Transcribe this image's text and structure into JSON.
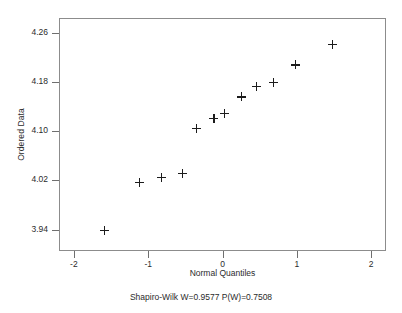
{
  "chart_data": {
    "type": "scatter",
    "title": "",
    "xlabel": "Normal Quantiles",
    "ylabel": "Ordered Data",
    "xlim": [
      -2.2,
      2.2
    ],
    "ylim": [
      3.905,
      4.285
    ],
    "xticks": [
      -2,
      -1,
      0,
      1,
      2
    ],
    "xticklabels": [
      "-2",
      "-1",
      "0",
      "1",
      "2"
    ],
    "yticks": [
      3.94,
      4.02,
      4.1,
      4.18,
      4.26
    ],
    "yticklabels": [
      "3.94",
      "4.02",
      "4.10",
      "4.18",
      "4.26"
    ],
    "grid": false,
    "legend": null,
    "marker": "plus",
    "marker_color": "#1c1c1c",
    "frame_color": "#8c8c8c",
    "x": [
      -1.6,
      -1.13,
      -0.84,
      -0.55,
      -0.36,
      -0.13,
      0.01,
      0.24,
      0.44,
      0.67,
      0.97,
      1.46
    ],
    "y": [
      3.94,
      4.018,
      4.027,
      4.033,
      4.107,
      4.123,
      4.131,
      4.158,
      4.175,
      4.182,
      4.21,
      4.244
    ],
    "points": [
      {
        "x": -1.6,
        "y": 3.94
      },
      {
        "x": -1.13,
        "y": 4.018
      },
      {
        "x": -0.84,
        "y": 4.027
      },
      {
        "x": -0.55,
        "y": 4.033
      },
      {
        "x": -0.36,
        "y": 4.107
      },
      {
        "x": -0.13,
        "y": 4.123
      },
      {
        "x": 0.01,
        "y": 4.131
      },
      {
        "x": 0.24,
        "y": 4.158
      },
      {
        "x": 0.44,
        "y": 4.175
      },
      {
        "x": 0.67,
        "y": 4.182
      },
      {
        "x": 0.97,
        "y": 4.21
      },
      {
        "x": 1.46,
        "y": 4.244
      }
    ],
    "annotations": [
      {
        "text": "Shapiro-Wilk W=0.9577 P(W)=0.7508",
        "position": "below-axis"
      }
    ]
  },
  "caption": "Shapiro-Wilk W=0.9577 P(W)=0.7508",
  "statistics": {
    "test_name": "Shapiro-Wilk",
    "W": "0.9577",
    "P_W": "0.7508"
  }
}
